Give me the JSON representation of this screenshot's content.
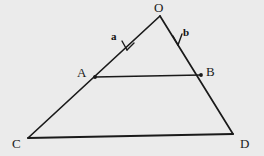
{
  "figure": {
    "name": "vector-triangle-diagram",
    "background_color": "#ebebeb",
    "stroke_color": "#1a1a1a",
    "width": 264,
    "height": 156,
    "points": {
      "O": {
        "x": 160,
        "y": 16
      },
      "A": {
        "x": 95,
        "y": 77
      },
      "B": {
        "x": 201,
        "y": 75
      },
      "C": {
        "x": 28,
        "y": 138
      },
      "D": {
        "x": 233,
        "y": 134
      }
    },
    "vertex_labels": {
      "O": "O",
      "A": "A",
      "B": "B",
      "C": "C",
      "D": "D"
    },
    "vector_labels": {
      "a": "a",
      "b": "b"
    },
    "segments": [
      {
        "name": "segment-OC",
        "from": "O",
        "to": "C"
      },
      {
        "name": "segment-OD",
        "from": "O",
        "to": "D"
      },
      {
        "name": "segment-AB",
        "from": "A",
        "to": "B"
      },
      {
        "name": "segment-CD",
        "from": "C",
        "to": "D"
      }
    ],
    "arrows": [
      {
        "name": "vector-a-arrow",
        "label": "a",
        "tip_x": 127,
        "tip_y": 50,
        "direction": "down-left"
      },
      {
        "name": "vector-b-arrow",
        "label": "b",
        "tip_x": 178,
        "tip_y": 45,
        "direction": "down"
      }
    ]
  }
}
